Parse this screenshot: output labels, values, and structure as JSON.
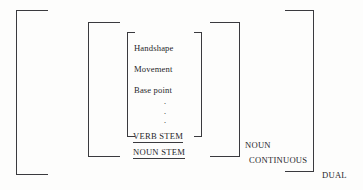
{
  "figure": {
    "kind": "linguistic-bracket-diagram",
    "background_color": "#fdfdfc",
    "line_color": "#3a3a3e",
    "text_color": "#26262a"
  },
  "feature_matrix": {
    "items": [
      {
        "label": "Handshape"
      },
      {
        "label": "Movement"
      },
      {
        "label": "Base point"
      }
    ],
    "ellipsis_dots": [
      "·",
      "·",
      "·"
    ]
  },
  "nodes": {
    "verb_stem": "VERB STEM",
    "noun_stem": "NOUN STEM",
    "noun": "NOUN",
    "continuous": "CONTINUOUS",
    "dual": "DUAL"
  },
  "brackets": [
    {
      "name": "dual-bracket",
      "side": "outer"
    },
    {
      "name": "continuous-bracket",
      "side": "outer"
    },
    {
      "name": "noun-bracket",
      "side": "outer"
    },
    {
      "name": "noun-stem-bracket",
      "side": "outer"
    },
    {
      "name": "verb-stem-bracket",
      "side": "inner"
    }
  ]
}
